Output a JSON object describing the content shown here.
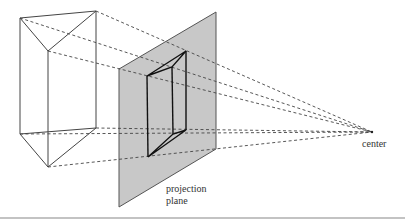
{
  "diagram": {
    "type": "perspective-projection",
    "labels": {
      "center": "center",
      "plane_line1": "projection",
      "plane_line2": "plane"
    },
    "colors": {
      "plane_fill": "#c8c8c8",
      "plane_stroke": "#555555",
      "object_stroke": "#444444",
      "projected_stroke": "#111111",
      "projector_stroke": "#444444",
      "rule": "#888888"
    },
    "center_point": [
      372,
      132
    ],
    "prism_vertices": {
      "top_left": [
        20,
        18
      ],
      "top_right": [
        96,
        11
      ],
      "top_front": [
        48,
        51
      ],
      "bottom_left": [
        20,
        134
      ],
      "bottom_right": [
        96,
        128
      ],
      "bottom_front": [
        48,
        167
      ]
    },
    "projection_plane": [
      [
        119,
        69
      ],
      [
        216,
        12
      ],
      [
        216,
        149
      ],
      [
        119,
        207
      ]
    ],
    "projected_vertices": {
      "top_left": [
        147,
        76
      ],
      "top_right": [
        186,
        51
      ],
      "top_front": [
        172,
        67
      ],
      "bottom_left": [
        148,
        157
      ],
      "bottom_right": [
        186,
        130
      ],
      "bottom_front": [
        173,
        134
      ]
    }
  }
}
